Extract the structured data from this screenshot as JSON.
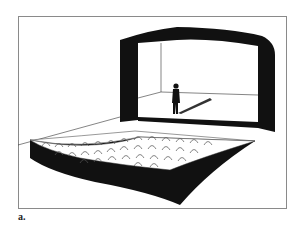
{
  "figure": {
    "caption": "a.",
    "colors": {
      "ink": "#111111",
      "frame": "#8a8a8a",
      "background": "#ffffff",
      "seat_arc": "#555555"
    }
  }
}
